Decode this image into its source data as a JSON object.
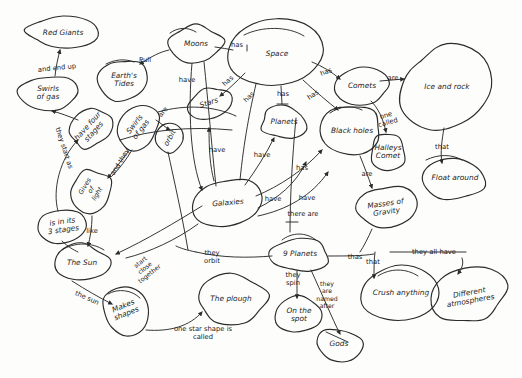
{
  "diagram": {
    "style": "hand-drawn pencil concept map on white paper",
    "ink_color": "#2b2b2b",
    "paper_color": "#fdfdfc",
    "width": 522,
    "height": 378
  },
  "nodes": [
    {
      "id": "red_giants",
      "label": "Red Giants",
      "x": 63,
      "y": 33,
      "rx": 34,
      "ry": 15,
      "rot": 0
    },
    {
      "id": "swirls_gas",
      "label": "Swirls\nof gas",
      "x": 48,
      "y": 93,
      "rx": 28,
      "ry": 17,
      "rot": 0
    },
    {
      "id": "earths_tides",
      "label": "Earth's\nTides",
      "x": 124,
      "y": 80,
      "rx": 25,
      "ry": 21,
      "rot": 0
    },
    {
      "id": "moons",
      "label": "Moons",
      "x": 196,
      "y": 44,
      "rx": 27,
      "ry": 19,
      "rot": 0
    },
    {
      "id": "space",
      "label": "Space",
      "x": 277,
      "y": 54,
      "rx": 44,
      "ry": 31,
      "rot": 0
    },
    {
      "id": "comets",
      "label": "Comets",
      "x": 362,
      "y": 86,
      "rx": 28,
      "ry": 17,
      "rot": 0
    },
    {
      "id": "ice_rock",
      "label": "Ice and rock",
      "x": 447,
      "y": 87,
      "rx": 45,
      "ry": 40,
      "rot": 0
    },
    {
      "id": "stars",
      "label": "Stars",
      "x": 209,
      "y": 103,
      "rx": 21,
      "ry": 15,
      "rot": -18
    },
    {
      "id": "planets",
      "label": "Planets",
      "x": 284,
      "y": 122,
      "rx": 23,
      "ry": 15,
      "rot": 0
    },
    {
      "id": "black_holes",
      "label": "Black holes",
      "x": 352,
      "y": 131,
      "rx": 30,
      "ry": 24,
      "rot": 0
    },
    {
      "id": "halleys",
      "label": "Halleys\nComet",
      "x": 388,
      "y": 152,
      "rx": 17,
      "ry": 19,
      "rot": 0
    },
    {
      "id": "float_around",
      "label": "Float around",
      "x": 455,
      "y": 178,
      "rx": 32,
      "ry": 20,
      "rot": 0
    },
    {
      "id": "have_four",
      "label": "have four\nstages",
      "x": 91,
      "y": 129,
      "rx": 22,
      "ry": 17,
      "rot": -48
    },
    {
      "id": "swirls_gas2",
      "label": "Swirls\nof gas",
      "x": 138,
      "y": 127,
      "rx": 23,
      "ry": 18,
      "rot": -52
    },
    {
      "id": "orbit",
      "label": "orbit",
      "x": 170,
      "y": 138,
      "rx": 14,
      "ry": 14,
      "rot": -60
    },
    {
      "id": "gives_light",
      "label": "Gives\nof\nlight",
      "x": 91,
      "y": 190,
      "rx": 21,
      "ry": 20,
      "rot": -58
    },
    {
      "id": "is_3_stages",
      "label": "is in its\n3 stages",
      "x": 63,
      "y": 226,
      "rx": 25,
      "ry": 15,
      "rot": -8
    },
    {
      "id": "galaxies",
      "label": "Galaxies",
      "x": 228,
      "y": 203,
      "rx": 32,
      "ry": 24,
      "rot": -5
    },
    {
      "id": "masses_grav",
      "label": "Masses of\nGravity",
      "x": 386,
      "y": 208,
      "rx": 28,
      "ry": 21,
      "rot": -8
    },
    {
      "id": "the_sun",
      "label": "The Sun",
      "x": 82,
      "y": 263,
      "rx": 27,
      "ry": 18,
      "rot": 0
    },
    {
      "id": "makes_shapes",
      "label": "Makes\nshapes",
      "x": 125,
      "y": 310,
      "rx": 22,
      "ry": 23,
      "rot": -22
    },
    {
      "id": "the_plough",
      "label": "The plough",
      "x": 231,
      "y": 299,
      "rx": 36,
      "ry": 23,
      "rot": 0
    },
    {
      "id": "nine_planets",
      "label": "9 Planets",
      "x": 300,
      "y": 254,
      "rx": 28,
      "ry": 17,
      "rot": 0
    },
    {
      "id": "on_the_spot",
      "label": "On the\nspot",
      "x": 299,
      "y": 315,
      "rx": 22,
      "ry": 18,
      "rot": 0
    },
    {
      "id": "gods",
      "label": "Gods",
      "x": 339,
      "y": 344,
      "rx": 22,
      "ry": 16,
      "rot": 0
    },
    {
      "id": "crush",
      "label": "Crush anything",
      "x": 401,
      "y": 293,
      "rx": 37,
      "ry": 26,
      "rot": 0
    },
    {
      "id": "diff_atmos",
      "label": "Different\natmospheres",
      "x": 470,
      "y": 297,
      "rx": 35,
      "ry": 27,
      "rot": -10
    }
  ],
  "link_labels": [
    {
      "id": "l_and_end_up",
      "text": "and end up",
      "x": 57,
      "y": 68,
      "rot": -6
    },
    {
      "id": "l_they_start",
      "text": "they start as",
      "x": 64,
      "y": 148,
      "rot": 72
    },
    {
      "id": "l_pull",
      "text": "Pull",
      "x": 145,
      "y": 60,
      "rot": 0
    },
    {
      "id": "l_have_moons",
      "text": "have",
      "x": 187,
      "y": 80,
      "rot": 0
    },
    {
      "id": "l_has_space1",
      "text": "has",
      "x": 237,
      "y": 45,
      "rot": 0
    },
    {
      "id": "l_has_space2",
      "text": "has",
      "x": 228,
      "y": 81,
      "rot": -42
    },
    {
      "id": "l_has_space3",
      "text": "has",
      "x": 249,
      "y": 97,
      "rot": -45
    },
    {
      "id": "l_has_space4",
      "text": "has",
      "x": 283,
      "y": 94,
      "rot": 0
    },
    {
      "id": "l_has_space5",
      "text": "has",
      "x": 313,
      "y": 95,
      "rot": -35
    },
    {
      "id": "l_has_comets",
      "text": "has",
      "x": 326,
      "y": 72,
      "rot": -22
    },
    {
      "id": "l_are_icerock",
      "text": "are",
      "x": 393,
      "y": 78,
      "rot": 0
    },
    {
      "id": "l_one_called",
      "text": "one\ncalled",
      "x": 387,
      "y": 119,
      "rot": -16
    },
    {
      "id": "l_that_float",
      "text": "that",
      "x": 442,
      "y": 147,
      "rot": 0
    },
    {
      "id": "l_are_masses",
      "text": "are",
      "x": 367,
      "y": 174,
      "rot": 0
    },
    {
      "id": "l_are_swirl",
      "text": "are",
      "x": 163,
      "y": 112,
      "rot": -52
    },
    {
      "id": "l_and_they",
      "text": "and they",
      "x": 120,
      "y": 162,
      "rot": -58
    },
    {
      "id": "l_like",
      "text": "like",
      "x": 92,
      "y": 231,
      "rot": 0
    },
    {
      "id": "l_have_gal1",
      "text": "have",
      "x": 217,
      "y": 150,
      "rot": 0
    },
    {
      "id": "l_have_gal2",
      "text": "have",
      "x": 262,
      "y": 155,
      "rot": 0
    },
    {
      "id": "l_has_gal",
      "text": "has",
      "x": 302,
      "y": 168,
      "rot": 0
    },
    {
      "id": "l_have_gal3",
      "text": "have",
      "x": 273,
      "y": 199,
      "rot": 0
    },
    {
      "id": "l_have_gal4",
      "text": "have",
      "x": 307,
      "y": 198,
      "rot": 0
    },
    {
      "id": "l_there_are",
      "text": "there are",
      "x": 303,
      "y": 214,
      "rot": 0
    },
    {
      "id": "l_start_close",
      "text": "start\nclose\ntogether",
      "x": 145,
      "y": 268,
      "rot": -38
    },
    {
      "id": "l_they_orbit",
      "text": "they\norbit",
      "x": 212,
      "y": 257,
      "rot": 0
    },
    {
      "id": "l_the_sun",
      "text": "the sun",
      "x": 87,
      "y": 298,
      "rot": 24
    },
    {
      "id": "l_one_star",
      "text": "one star shape is\ncalled",
      "x": 203,
      "y": 333,
      "rot": 0
    },
    {
      "id": "l_thas",
      "text": "thas",
      "x": 355,
      "y": 257,
      "rot": 0
    },
    {
      "id": "l_they_all",
      "text": "they all have",
      "x": 434,
      "y": 252,
      "rot": 0
    },
    {
      "id": "l_that_crush",
      "text": "that",
      "x": 373,
      "y": 262,
      "rot": 0
    },
    {
      "id": "l_they_spin",
      "text": "they\nspin",
      "x": 293,
      "y": 279,
      "rot": 0
    },
    {
      "id": "l_named_after",
      "text": "they\nare\nnamed\nafter",
      "x": 327,
      "y": 295,
      "rot": 0
    }
  ],
  "edges": [
    {
      "id": "e_swirl_red",
      "from": "swirls_gas",
      "to": "red_giants",
      "label": "and end up"
    },
    {
      "id": "e_four_swirl",
      "from": "have_four",
      "to": "swirls_gas",
      "label": "they start as"
    },
    {
      "id": "e_moons_tides",
      "from": "moons",
      "to": "earths_tides",
      "label": "Pull"
    },
    {
      "id": "e_space_moons",
      "from": "space",
      "to": "moons",
      "label": "has"
    },
    {
      "id": "e_space_stars",
      "from": "space",
      "to": "stars",
      "label": "has"
    },
    {
      "id": "e_space_planets",
      "from": "space",
      "to": "planets",
      "label": "has"
    },
    {
      "id": "e_space_black",
      "from": "space",
      "to": "black_holes",
      "label": "has"
    },
    {
      "id": "e_space_comets",
      "from": "space",
      "to": "comets",
      "label": "has"
    },
    {
      "id": "e_comets_ice",
      "from": "comets",
      "to": "ice_rock",
      "label": "are"
    },
    {
      "id": "e_comets_hal",
      "from": "comets",
      "to": "halleys",
      "label": "one called"
    },
    {
      "id": "e_ice_float",
      "from": "ice_rock",
      "to": "float_around",
      "label": "that"
    },
    {
      "id": "e_black_mass",
      "from": "black_holes",
      "to": "masses_grav",
      "label": "are"
    },
    {
      "id": "e_gal_stars",
      "from": "galaxies",
      "to": "stars",
      "label": "have"
    },
    {
      "id": "e_gal_planets",
      "from": "galaxies",
      "to": "planets",
      "label": "have"
    },
    {
      "id": "e_gal_black",
      "from": "galaxies",
      "to": "black_holes",
      "label": "has"
    },
    {
      "id": "e_gal_mass",
      "from": "galaxies",
      "to": "masses_grav",
      "label": "there are"
    },
    {
      "id": "e_moons_have",
      "from": "moons",
      "to": "galaxies",
      "label": "have"
    },
    {
      "id": "e_sun_stage",
      "from": "is_3_stages",
      "to": "the_sun",
      "label": "like"
    },
    {
      "id": "e_sun_makes",
      "from": "the_sun",
      "to": "makes_shapes",
      "label": "the sun"
    },
    {
      "id": "e_makes_plough",
      "from": "makes_shapes",
      "to": "the_plough",
      "label": "one star shape is called"
    },
    {
      "id": "e_gal_sun",
      "from": "galaxies",
      "to": "the_sun",
      "label": "start close together"
    },
    {
      "id": "e_nine_gal",
      "from": "nine_planets",
      "to": "galaxies",
      "label": "they orbit"
    },
    {
      "id": "e_nine_spot",
      "from": "nine_planets",
      "to": "on_the_spot",
      "label": "they spin"
    },
    {
      "id": "e_nine_gods",
      "from": "nine_planets",
      "to": "gods",
      "label": "they are named after"
    },
    {
      "id": "e_nine_crush",
      "from": "nine_planets",
      "to": "crush",
      "label": "thas / that"
    },
    {
      "id": "e_nine_atmos",
      "from": "nine_planets",
      "to": "diff_atmos",
      "label": "they all have"
    },
    {
      "id": "e_stars_gives",
      "from": "gives_light",
      "to": "have_four",
      "label": "and they"
    },
    {
      "id": "e_swirl2_orbit",
      "from": "swirls_gas2",
      "to": "orbit",
      "label": "are"
    }
  ]
}
